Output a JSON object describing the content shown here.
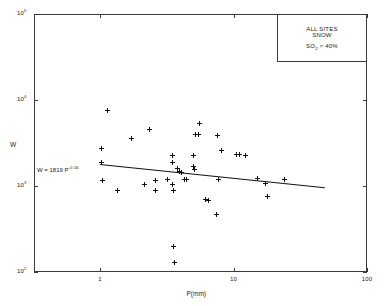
{
  "chart_data": {
    "type": "scatter",
    "title": "",
    "xlabel": "P(mm)",
    "ylabel": "W",
    "xscale": "log",
    "yscale": "log",
    "xlim": [
      1,
      100
    ],
    "ylim": [
      100,
      100000
    ],
    "xticks": [
      "1",
      "10",
      "100"
    ],
    "xtick_values": [
      1,
      10,
      100
    ],
    "yticks": [
      "10²",
      "10³",
      "10⁴",
      "10⁵"
    ],
    "ytick_values": [
      100,
      1000,
      10000,
      100000
    ],
    "grid": false,
    "legend_position": "top-right",
    "annotations": [
      {
        "name": "fit-equation",
        "text": "W  =  1819 P",
        "exponent": "-0.16"
      }
    ],
    "series": [
      {
        "name": "observations",
        "marker": "plus",
        "color": "#111111",
        "points": [
          {
            "x": 1.02,
            "y": 1870
          },
          {
            "x": 1.02,
            "y": 2700
          },
          {
            "x": 1.05,
            "y": 1150
          },
          {
            "x": 1.13,
            "y": 7600
          },
          {
            "x": 1.35,
            "y": 880
          },
          {
            "x": 1.72,
            "y": 3600
          },
          {
            "x": 2.15,
            "y": 1050
          },
          {
            "x": 2.35,
            "y": 4500
          },
          {
            "x": 2.6,
            "y": 880
          },
          {
            "x": 2.62,
            "y": 1150
          },
          {
            "x": 3.2,
            "y": 1180
          },
          {
            "x": 3.5,
            "y": 2250
          },
          {
            "x": 3.5,
            "y": 1900
          },
          {
            "x": 3.5,
            "y": 1050
          },
          {
            "x": 3.55,
            "y": 880
          },
          {
            "x": 3.55,
            "y": 200
          },
          {
            "x": 3.6,
            "y": 128
          },
          {
            "x": 3.8,
            "y": 1600
          },
          {
            "x": 3.95,
            "y": 1480
          },
          {
            "x": 4.1,
            "y": 1420
          },
          {
            "x": 4.3,
            "y": 1180
          },
          {
            "x": 4.45,
            "y": 1180
          },
          {
            "x": 5.0,
            "y": 2250
          },
          {
            "x": 5.05,
            "y": 1700
          },
          {
            "x": 5.1,
            "y": 1550
          },
          {
            "x": 5.2,
            "y": 3950
          },
          {
            "x": 5.45,
            "y": 3950
          },
          {
            "x": 5.6,
            "y": 5400
          },
          {
            "x": 6.2,
            "y": 690
          },
          {
            "x": 6.5,
            "y": 680
          },
          {
            "x": 7.4,
            "y": 470
          },
          {
            "x": 7.6,
            "y": 3900
          },
          {
            "x": 7.7,
            "y": 1180
          },
          {
            "x": 8.1,
            "y": 2600
          },
          {
            "x": 10.5,
            "y": 2300
          },
          {
            "x": 11.0,
            "y": 2300
          },
          {
            "x": 12.3,
            "y": 2250
          },
          {
            "x": 15.0,
            "y": 1220
          },
          {
            "x": 17.5,
            "y": 1060
          },
          {
            "x": 18.0,
            "y": 760
          },
          {
            "x": 24.0,
            "y": 1180
          }
        ]
      }
    ],
    "fit_line": {
      "name": "power-law-fit",
      "equation_label": "W  =  1819 P",
      "equation_exponent": "-0.16",
      "coefficient": 1819,
      "exponent": -0.16,
      "x_start": 1.0,
      "x_end": 48.0,
      "color": "#111111"
    },
    "legend": {
      "line1": "ALL SITES",
      "line2": "SNOW",
      "line3_prefix": "SO",
      "line3_sub": "2",
      "line3_suffix": " < 40%"
    }
  }
}
